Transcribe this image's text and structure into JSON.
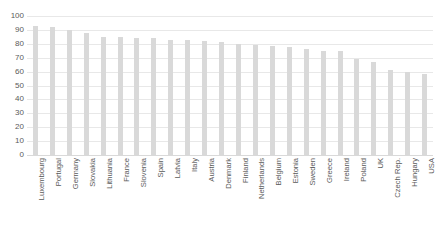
{
  "chart_data": {
    "type": "bar",
    "title": "",
    "xlabel": "",
    "ylabel": "",
    "ylim": [
      0,
      100
    ],
    "ytick_step": 10,
    "yticks": [
      100,
      90,
      80,
      70,
      60,
      50,
      40,
      30,
      20,
      10,
      0
    ],
    "grid": true,
    "legend": false,
    "legend_position": "none",
    "bar_color": "#d9d9d9",
    "sorted": "descending",
    "categories": [
      "Luxembourg",
      "Portugal",
      "Germany",
      "Slovakia",
      "Lithuania",
      "France",
      "Slovenia",
      "Spain",
      "Latvia",
      "Italy",
      "Austria",
      "Denmark",
      "Finland",
      "Netherlands",
      "Belgium",
      "Estonia",
      "Sweden",
      "Greece",
      "Ireland",
      "Poland",
      "UK",
      "Czech Rep.",
      "Hungary",
      "USA"
    ],
    "values": [
      93,
      92,
      90,
      88,
      85,
      85,
      84.5,
      84.5,
      83,
      82.5,
      82,
      81,
      80,
      79.5,
      78.5,
      77.5,
      76.5,
      75,
      74.5,
      69,
      67,
      61,
      60,
      58.5
    ],
    "series": [
      {
        "name": "",
        "values": [
          93,
          92,
          90,
          88,
          85,
          85,
          84.5,
          84.5,
          83,
          82.5,
          82,
          81,
          80,
          79.5,
          78.5,
          77.5,
          76.5,
          75,
          74.5,
          69,
          67,
          61,
          60,
          58.5
        ]
      }
    ]
  },
  "title_fragment": ""
}
